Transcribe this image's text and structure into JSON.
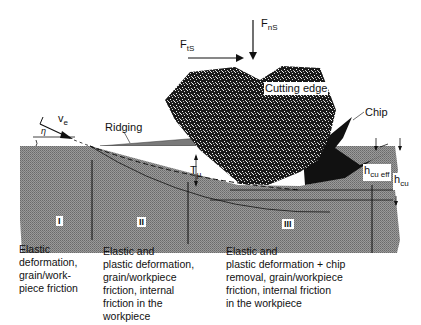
{
  "forces": {
    "normal": {
      "base": "F",
      "sub": "nS"
    },
    "tangential": {
      "base": "F",
      "sub": "tS"
    }
  },
  "labels": {
    "cutting_edge": "Cutting edge",
    "chip": "Chip",
    "ridging": "Ridging",
    "velocity": {
      "base": "v",
      "sub": "e"
    },
    "angle": "η",
    "t_mu": {
      "base": "T",
      "sub": "μ"
    },
    "h_cu_eff": {
      "base": "h",
      "sub": "cu eff"
    },
    "h_cu": {
      "base": "h",
      "sub": "cu"
    }
  },
  "zones": [
    {
      "id": "I",
      "description": "Elastic deformation, grain/work-piece friction",
      "lines": [
        "Elastic",
        "deformation,",
        "grain/work-",
        "piece friction"
      ]
    },
    {
      "id": "II",
      "description": "Elastic and plastic deformation, grain/workpiece friction, internal friction in the workpiece",
      "lines": [
        "Elastic and",
        "plastic deformation,",
        "grain/workpiece",
        "friction, internal",
        "friction in the",
        "workpiece"
      ]
    },
    {
      "id": "III",
      "description": "Elastic and plastic deformation + chip removal, grain/workpiece friction, internal friction in the workpiece",
      "lines": [
        "Elastic and",
        "plastic deformation + chip",
        "removal, grain/workpiece",
        "friction, internal friction",
        "in the workpiece"
      ]
    }
  ],
  "colors": {
    "workpiece": "#8a8a8a",
    "grain": "#1a1a1a",
    "chip": "#111111",
    "background": "#ffffff"
  }
}
